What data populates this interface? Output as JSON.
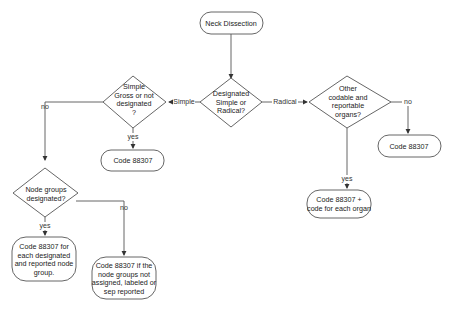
{
  "diagram": {
    "nodes": {
      "start": {
        "lines": [
          "Neck Dissection"
        ]
      },
      "decision_main": {
        "lines": [
          "Designated",
          "Simple or",
          "Radical?"
        ]
      },
      "decision_simple": {
        "lines": [
          "Simple",
          "Gross or not",
          "designated",
          "?"
        ]
      },
      "decision_radical": {
        "lines": [
          "Other",
          "codable and",
          "reportable",
          "organs?"
        ]
      },
      "code_simple_yes": {
        "lines": [
          "Code 88307"
        ]
      },
      "code_radical_no": {
        "lines": [
          "Code 88307"
        ]
      },
      "code_radical_yes": {
        "lines": [
          "Code 88307 +",
          "code for each organ"
        ]
      },
      "decision_node_groups": {
        "lines": [
          "Node groups",
          "designated?"
        ]
      },
      "code_node_yes": {
        "lines": [
          "Code 88307 for",
          "each designated",
          "and reported node",
          "group."
        ]
      },
      "code_node_no": {
        "lines": [
          "Code 88307 if the",
          "node groups not",
          "assigned, labeled or",
          "sep reported"
        ]
      }
    },
    "edge_labels": {
      "simple": "Simple",
      "radical": "Radical",
      "simple_yes": "yes",
      "simple_no": "no",
      "radical_yes": "yes",
      "radical_no": "no",
      "node_yes": "yes",
      "node_no": "no"
    },
    "colors": {
      "stroke": "#555555",
      "text": "#222222",
      "background": "#ffffff"
    }
  }
}
